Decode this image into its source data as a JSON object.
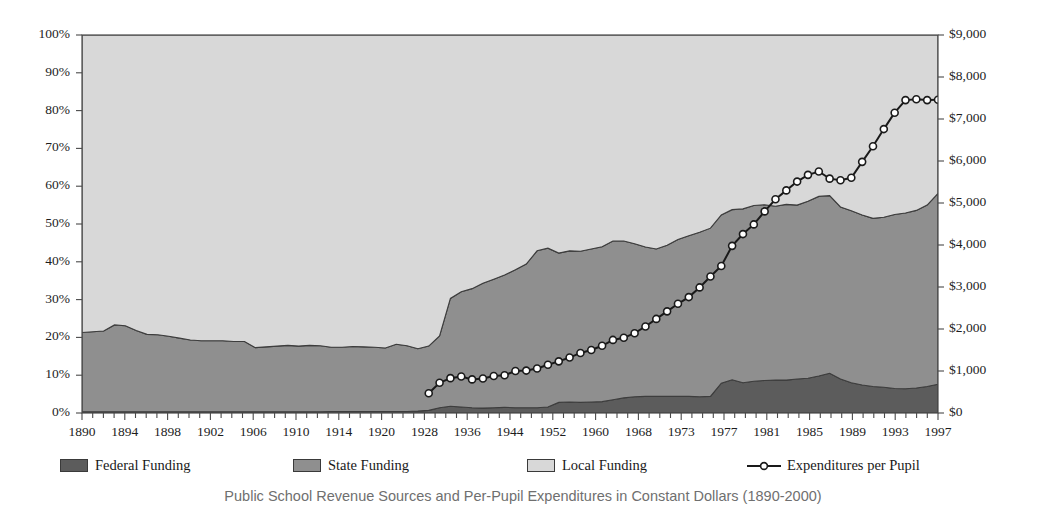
{
  "caption": "Public School Revenue Sources and Per-Pupil Expenditures in Constant Dollars (1890-2000)",
  "legend": {
    "items": [
      {
        "label": "Federal Funding",
        "color": "#5c5c5c",
        "marker": "area-swatch"
      },
      {
        "label": "State Funding",
        "color": "#8f8f8f",
        "marker": "area-swatch"
      },
      {
        "label": "Local Funding",
        "color": "#d8d8d8",
        "marker": "area-swatch"
      },
      {
        "label": "Expenditures per Pupil",
        "color": "#1a1a1a",
        "marker": "line-marker-icon"
      }
    ]
  },
  "axes": {
    "left": {
      "ticks": [
        "0%",
        "10%",
        "20%",
        "30%",
        "40%",
        "50%",
        "60%",
        "70%",
        "80%",
        "90%",
        "100%"
      ],
      "min": 0,
      "max": 100
    },
    "right": {
      "ticks": [
        "$0",
        "$1,000",
        "$2,000",
        "$3,000",
        "$4,000",
        "$5,000",
        "$6,000",
        "$7,000",
        "$8,000",
        "$9,000"
      ],
      "min": 0,
      "max": 9000
    },
    "bottom": {
      "ticks": [
        "1890",
        "1894",
        "1898",
        "1902",
        "1906",
        "1910",
        "1914",
        "1920",
        "1928",
        "1936",
        "1944",
        "1952",
        "1960",
        "1968",
        "1973",
        "1977",
        "1981",
        "1985",
        "1989",
        "1993",
        "1997"
      ]
    }
  },
  "chart_data": {
    "type": "area",
    "title": "Public School Revenue Sources and Per-Pupil Expenditures in Constant Dollars (1890-2000)",
    "xlabel": "",
    "ylabel": "Share of Funding",
    "ylabel_secondary": "Expenditures per Pupil",
    "ylim": [
      0,
      100
    ],
    "ylim_secondary": [
      0,
      9000
    ],
    "grid": false,
    "legend_position": "bottom",
    "stacked": true,
    "x_tick_labels": [
      "1890",
      "1894",
      "1898",
      "1902",
      "1906",
      "1910",
      "1914",
      "1920",
      "1928",
      "1936",
      "1944",
      "1952",
      "1960",
      "1968",
      "1973",
      "1977",
      "1981",
      "1985",
      "1989",
      "1993",
      "1997"
    ],
    "x_index": [
      0,
      1,
      2,
      3,
      4,
      5,
      6,
      7,
      8,
      9,
      10,
      11,
      12,
      13,
      14,
      15,
      16,
      17,
      18,
      19,
      20,
      21,
      22,
      23,
      24,
      25,
      26,
      27,
      28,
      29,
      30,
      31,
      32,
      33,
      34,
      35,
      36,
      37,
      38,
      39,
      40,
      41,
      42,
      43,
      44,
      45,
      46,
      47,
      48,
      49,
      50,
      51,
      52,
      53,
      54,
      55,
      56,
      57,
      58,
      59,
      60,
      61,
      62,
      63,
      64,
      65,
      66,
      67,
      68,
      69,
      70,
      71,
      72,
      73,
      74,
      75,
      76,
      77,
      78,
      79
    ],
    "series": [
      {
        "name": "Federal Funding",
        "color": "#5c5c5c",
        "stack_order": 1,
        "values": [
          0.3,
          0.3,
          0.3,
          0.3,
          0.3,
          0.3,
          0.3,
          0.3,
          0.3,
          0.3,
          0.3,
          0.3,
          0.3,
          0.3,
          0.3,
          0.3,
          0.3,
          0.3,
          0.3,
          0.3,
          0.3,
          0.3,
          0.3,
          0.4,
          0.4,
          0.4,
          0.4,
          0.4,
          0.4,
          0.4,
          0.4,
          0.5,
          0.7,
          1.4,
          1.8,
          1.6,
          1.4,
          1.3,
          1.4,
          1.5,
          1.4,
          1.4,
          1.4,
          1.6,
          2.8,
          2.9,
          2.8,
          2.9,
          3.0,
          3.5,
          4.0,
          4.3,
          4.4,
          4.4,
          4.4,
          4.4,
          4.4,
          4.3,
          4.4,
          7.9,
          8.8,
          8.0,
          8.4,
          8.6,
          8.7,
          8.7,
          9.0,
          9.2,
          9.8,
          10.5,
          9.0,
          8.0,
          7.4,
          7.0,
          6.8,
          6.5,
          6.4,
          6.6,
          7.0,
          7.6
        ]
      },
      {
        "name": "State Funding",
        "color": "#8f8f8f",
        "stack_order": 2,
        "values": [
          21.0,
          21.2,
          21.4,
          23.0,
          22.8,
          21.5,
          20.5,
          20.4,
          20.0,
          19.5,
          19.0,
          18.8,
          18.8,
          18.8,
          18.6,
          18.6,
          17.0,
          17.2,
          17.4,
          17.6,
          17.4,
          17.6,
          17.5,
          17.0,
          17.0,
          17.2,
          17.1,
          17.0,
          16.8,
          17.8,
          17.4,
          16.5,
          17.0,
          19.0,
          28.5,
          30.5,
          31.5,
          33.0,
          34.0,
          35.0,
          36.5,
          38.0,
          41.5,
          42.0,
          39.5,
          40.0,
          40.0,
          40.5,
          41.0,
          42.0,
          41.5,
          40.5,
          39.5,
          39.0,
          40.0,
          41.5,
          42.5,
          43.5,
          44.5,
          44.5,
          45.0,
          46.0,
          46.5,
          46.5,
          46.0,
          46.5,
          46.0,
          46.8,
          47.5,
          47.0,
          45.5,
          45.5,
          45.0,
          44.5,
          45.0,
          46.0,
          46.5,
          47.0,
          48.0,
          50.5
        ]
      },
      {
        "name": "Local Funding",
        "color": "#d8d8d8",
        "stack_order": 3,
        "values": [
          78.7,
          78.5,
          78.3,
          76.7,
          76.9,
          78.2,
          79.2,
          79.3,
          79.7,
          80.2,
          80.7,
          80.9,
          80.9,
          80.9,
          81.1,
          81.1,
          82.7,
          82.5,
          82.3,
          82.1,
          82.3,
          82.1,
          82.2,
          82.6,
          82.6,
          82.4,
          82.5,
          82.6,
          82.8,
          81.8,
          82.2,
          83.0,
          82.3,
          79.6,
          69.7,
          67.9,
          67.1,
          65.7,
          64.6,
          63.5,
          62.1,
          60.6,
          57.1,
          56.4,
          57.7,
          57.1,
          57.2,
          56.6,
          56.0,
          54.5,
          54.5,
          55.2,
          56.1,
          56.6,
          55.6,
          54.1,
          53.1,
          52.2,
          51.1,
          47.6,
          46.2,
          46.0,
          45.1,
          44.9,
          45.3,
          44.8,
          45.0,
          44.0,
          42.7,
          42.5,
          45.5,
          46.5,
          47.6,
          48.5,
          48.2,
          47.5,
          47.1,
          46.4,
          45.0,
          41.9
        ]
      }
    ],
    "line_series": {
      "name": "Expenditures per Pupil",
      "color": "#1a1a1a",
      "axis": "right",
      "marker": "circle-open",
      "x_index": [
        32,
        33,
        34,
        35,
        36,
        37,
        38,
        39,
        40,
        41,
        42,
        43,
        44,
        45,
        46,
        47,
        48,
        49,
        50,
        51,
        52,
        53,
        54,
        55,
        56,
        57,
        58,
        59,
        60,
        61,
        62,
        63,
        64,
        65,
        66,
        67,
        68,
        69,
        70,
        71,
        72,
        73,
        74,
        75,
        76,
        77,
        78,
        79
      ],
      "values": [
        470,
        720,
        830,
        870,
        800,
        820,
        880,
        900,
        1000,
        1010,
        1060,
        1150,
        1230,
        1320,
        1430,
        1500,
        1600,
        1740,
        1790,
        1900,
        2060,
        2240,
        2420,
        2600,
        2760,
        2990,
        3250,
        3500,
        3980,
        4260,
        4490,
        4800,
        5090,
        5300,
        5510,
        5670,
        5750,
        5580,
        5540,
        5600,
        5980,
        6350,
        6760,
        7150,
        7450,
        7470,
        7450,
        7460,
        7440,
        7480,
        7550,
        7680,
        7900,
        8100,
        8320
      ]
    }
  }
}
